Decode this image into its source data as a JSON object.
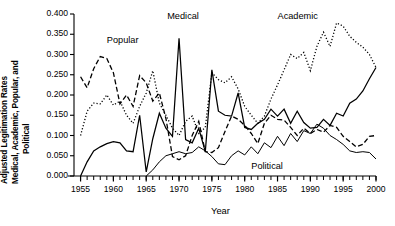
{
  "chart_data": {
    "type": "line",
    "title": "",
    "xlabel": "Year",
    "ylabel": "Adjusted Legitimation Rates Medical, Academic, Popular, and Political",
    "ylabel_lines": [
      "Adjusted Legitimation Rates",
      "Medical, Academic, Popular, and",
      "Political"
    ],
    "xlim": [
      1954,
      2000
    ],
    "ylim": [
      0.0,
      0.4
    ],
    "grid": false,
    "legend_position": "inline-annotations",
    "yticks": [
      "0.000",
      "0.050",
      "0.100",
      "0.150",
      "0.200",
      "0.250",
      "0.300",
      "0.350",
      "0.400"
    ],
    "ytick_values": [
      0.0,
      0.05,
      0.1,
      0.15,
      0.2,
      0.25,
      0.3,
      0.35,
      0.4
    ],
    "xticks": [
      "1955",
      "1960",
      "1965",
      "1970",
      "1975",
      "1980",
      "1985",
      "1990",
      "1995",
      "2000"
    ],
    "xtick_values": [
      1955,
      1960,
      1965,
      1970,
      1975,
      1980,
      1985,
      1990,
      1995,
      2000
    ],
    "minor_xtick_step": 1,
    "annotations": [
      {
        "text": "Popular",
        "x": 1959.0,
        "y": 0.333
      },
      {
        "text": "Medical",
        "x": 1968.2,
        "y": 0.392
      },
      {
        "text": "Academic",
        "x": 1985.0,
        "y": 0.392
      },
      {
        "text": "Political",
        "x": 1981.0,
        "y": 0.022
      }
    ],
    "x": [
      1955,
      1956,
      1957,
      1958,
      1959,
      1960,
      1961,
      1962,
      1963,
      1964,
      1965,
      1966,
      1967,
      1968,
      1969,
      1970,
      1971,
      1972,
      1973,
      1974,
      1975,
      1976,
      1977,
      1978,
      1979,
      1980,
      1981,
      1982,
      1983,
      1984,
      1985,
      1986,
      1987,
      1988,
      1989,
      1990,
      1991,
      1992,
      1993,
      1994,
      1995,
      1996,
      1997,
      1998,
      1999,
      2000
    ],
    "series": [
      {
        "name": "Medical",
        "style": "solid",
        "color": "#000000",
        "values": [
          0.0,
          0.035,
          0.062,
          0.072,
          0.08,
          0.085,
          0.082,
          0.062,
          0.06,
          0.15,
          0.01,
          0.092,
          0.155,
          0.118,
          0.098,
          0.34,
          0.09,
          0.082,
          0.118,
          0.06,
          0.262,
          0.16,
          0.15,
          0.148,
          0.205,
          0.12,
          0.115,
          0.13,
          0.14,
          0.165,
          0.148,
          0.165,
          0.13,
          0.16,
          0.132,
          0.118,
          0.12,
          0.14,
          0.125,
          0.155,
          0.148,
          0.18,
          0.19,
          0.21,
          0.24,
          0.268
        ]
      },
      {
        "name": "Academic",
        "style": "dotted",
        "color": "#000000",
        "values": [
          0.1,
          0.16,
          0.18,
          0.178,
          0.2,
          0.175,
          0.185,
          0.15,
          0.13,
          0.172,
          0.205,
          0.26,
          0.18,
          0.15,
          0.118,
          0.1,
          0.135,
          0.148,
          0.105,
          0.12,
          0.255,
          0.238,
          0.23,
          0.245,
          0.215,
          0.172,
          0.15,
          0.13,
          0.148,
          0.19,
          0.225,
          0.262,
          0.3,
          0.29,
          0.305,
          0.26,
          0.32,
          0.355,
          0.32,
          0.378,
          0.37,
          0.345,
          0.33,
          0.318,
          0.3,
          0.268
        ]
      },
      {
        "name": "Popular",
        "style": "dashed",
        "color": "#000000",
        "values": [
          0.245,
          0.218,
          0.265,
          0.295,
          0.29,
          0.255,
          0.178,
          0.2,
          0.172,
          0.248,
          0.23,
          0.185,
          0.205,
          0.142,
          0.048,
          0.04,
          0.05,
          0.1,
          0.135,
          0.06,
          0.058,
          0.07,
          0.11,
          0.148,
          0.14,
          0.125,
          0.105,
          0.08,
          0.13,
          0.15,
          0.14,
          0.138,
          0.12,
          0.1,
          0.118,
          0.105,
          0.115,
          0.108,
          0.125,
          0.12,
          0.098,
          0.085,
          0.072,
          0.078,
          0.098,
          0.1
        ]
      },
      {
        "name": "Political",
        "style": "solid-thin",
        "color": "#000000",
        "values": [
          null,
          null,
          null,
          null,
          null,
          null,
          null,
          null,
          null,
          null,
          0.0,
          0.015,
          0.035,
          0.05,
          0.055,
          0.06,
          0.055,
          0.058,
          0.072,
          0.062,
          0.048,
          0.03,
          0.028,
          0.05,
          0.062,
          0.052,
          0.072,
          0.055,
          0.082,
          0.07,
          0.098,
          0.075,
          0.105,
          0.085,
          0.112,
          0.105,
          0.128,
          0.118,
          0.1,
          0.09,
          0.078,
          0.062,
          0.058,
          0.06,
          0.058,
          0.042
        ]
      }
    ]
  },
  "layout": {
    "plot_left": 74,
    "plot_right": 376,
    "plot_top": 14,
    "plot_bottom": 176
  }
}
